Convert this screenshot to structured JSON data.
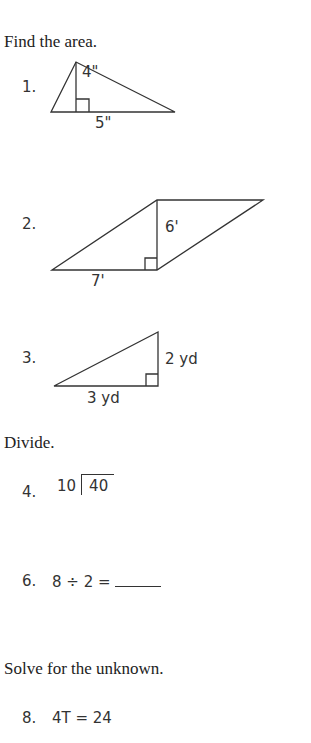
{
  "sections": [
    {
      "heading": "Find the area.",
      "problems": [
        {
          "number": "1.",
          "shape": "triangle",
          "height_label": "4\"",
          "base_label": "5\""
        },
        {
          "number": "2.",
          "shape": "parallelogram",
          "height_label": "6'",
          "base_label": "7'"
        },
        {
          "number": "3.",
          "shape": "right-triangle",
          "height_label": "2 yd",
          "base_label": "3 yd"
        }
      ]
    },
    {
      "heading": "Divide.",
      "problems": [
        {
          "number": "4.",
          "divisor": "10",
          "dividend": "40"
        },
        {
          "number": "6.",
          "expression": "8 ÷ 2 ="
        }
      ]
    },
    {
      "heading": "Solve for the unknown.",
      "problems": [
        {
          "number": "8.",
          "equation": "4T = 24"
        }
      ]
    }
  ]
}
